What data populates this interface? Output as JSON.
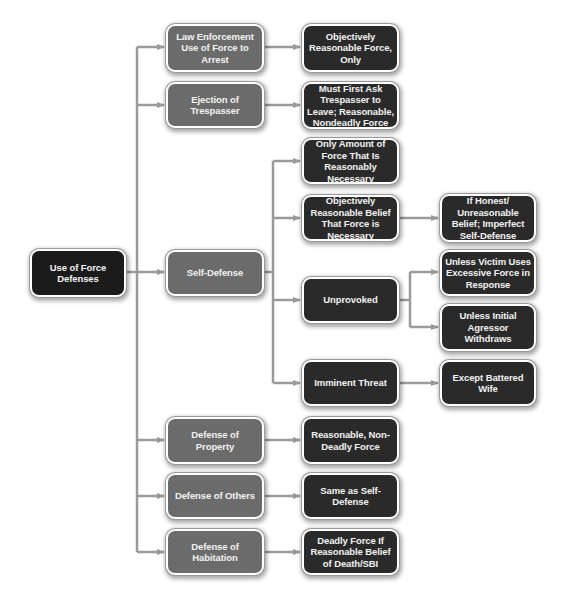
{
  "diagram": {
    "colors": {
      "root_fill": "#1b1b1b",
      "category_fill": "#6b6b6b",
      "detail_fill": "#2a2a2a",
      "connector": "#9a9a9a",
      "text": "#f2f2f2"
    },
    "root": {
      "label": "Use of Force Defenses"
    },
    "categories": [
      {
        "label": "Law Enforcement Use of Force to Arrest"
      },
      {
        "label": "Ejection of Trespasser"
      },
      {
        "label": "Self-Defense"
      },
      {
        "label": "Defense of Property"
      },
      {
        "label": "Defense of Others"
      },
      {
        "label": "Defense of Habitation"
      }
    ],
    "details": {
      "law_enforcement": {
        "label": "Objectively Reasonable Force, Only"
      },
      "ejection": {
        "label": "Must First Ask Trespasser to Leave; Reasonable, Nondeadly Force"
      },
      "self_defense": [
        {
          "label": "Only Amount of Force That Is Reasonably Necessary"
        },
        {
          "label": "Objectively Reasonable Belief That Force is Necessary"
        },
        {
          "label": "Unprovoked"
        },
        {
          "label": "Imminent Threat"
        }
      ],
      "property": {
        "label": "Reasonable, Non-Deadly Force"
      },
      "others": {
        "label": "Same as Self-Defense"
      },
      "habitation": {
        "label": "Deadly Force If Reasonable Belief of Death/SBI"
      }
    },
    "exceptions": {
      "belief": {
        "label": "If Honest/ Unreasonable Belief; Imperfect Self-Defense"
      },
      "unprovoked": [
        {
          "label": "Unless Victim Uses Excessive Force in Response"
        },
        {
          "label": "Unless Initial Agressor Withdraws"
        }
      ],
      "imminent": {
        "label": "Except Battered Wife"
      }
    }
  }
}
